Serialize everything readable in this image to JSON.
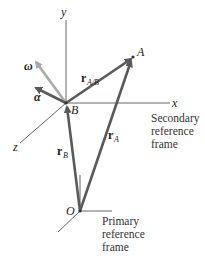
{
  "diagram": {
    "type": "relative-motion-rotating-axes",
    "colors": {
      "axis": "#555555",
      "vector": "#5a5a5a",
      "omega": "#aaaaaa",
      "alpha": "#5a5a5a",
      "text": "#222222"
    },
    "points": {
      "A": {
        "label": "A",
        "x": 133,
        "y": 57
      },
      "B": {
        "label": "B",
        "x": 66,
        "y": 103
      },
      "O": {
        "label": "O",
        "x": 80,
        "y": 211
      }
    },
    "secondary_axes": {
      "x_label": "x",
      "y_label": "y",
      "z_label": "z"
    },
    "vectors": {
      "r_AB": {
        "main": "r",
        "sub": "A/B"
      },
      "r_A": {
        "main": "r",
        "sub": "A"
      },
      "r_B": {
        "main": "r",
        "sub": "B"
      },
      "omega": {
        "symbol": "ω"
      },
      "alpha": {
        "symbol": "α"
      }
    },
    "captions": {
      "secondary": [
        "Secondary",
        "reference",
        "frame"
      ],
      "primary": [
        "Primary",
        "reference",
        "frame"
      ]
    }
  }
}
